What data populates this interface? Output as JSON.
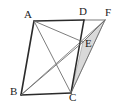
{
  "figure": {
    "kind": "geometry-diagram",
    "width": 122,
    "height": 109,
    "background_color": "#ffffff",
    "stroke_color_main": "#2b2b2b",
    "stroke_color_thin": "#6e6e6e",
    "shade_fill_color": "#d9d9d9",
    "shade_stroke_color": "#8a8a8a"
  },
  "labels": {
    "a": "A",
    "b": "B",
    "c": "C",
    "d": "D",
    "e": "E",
    "f": "F"
  },
  "points": {
    "A": {
      "x": 34,
      "y": 21
    },
    "B": {
      "x": 21,
      "y": 95
    },
    "C": {
      "x": 71,
      "y": 93
    },
    "D": {
      "x": 84,
      "y": 20
    },
    "E": {
      "x": 83,
      "y": 42
    },
    "F": {
      "x": 105,
      "y": 20
    }
  },
  "label_positions": {
    "A": {
      "x": 24,
      "y": 9
    },
    "B": {
      "x": 10,
      "y": 87
    },
    "C": {
      "x": 69,
      "y": 92
    },
    "D": {
      "x": 80,
      "y": 6
    },
    "E": {
      "x": 85,
      "y": 39
    },
    "F": {
      "x": 106,
      "y": 7
    }
  },
  "segments": [
    {
      "name": "segment-AD",
      "from": "A",
      "to": "D",
      "weight": "main"
    },
    {
      "name": "segment-DF",
      "from": "D",
      "to": "F",
      "weight": "thin"
    },
    {
      "name": "segment-AB",
      "from": "A",
      "to": "B",
      "weight": "main"
    },
    {
      "name": "segment-BC",
      "from": "B",
      "to": "C",
      "weight": "main"
    },
    {
      "name": "segment-DC",
      "from": "D",
      "to": "C",
      "weight": "main"
    },
    {
      "name": "segment-AC",
      "from": "A",
      "to": "C",
      "weight": "thin"
    },
    {
      "name": "segment-AF",
      "from": "A",
      "to": "F",
      "weight": "thin"
    },
    {
      "name": "segment-BE",
      "from": "B",
      "to": "E",
      "weight": "thin"
    },
    {
      "name": "segment-BF",
      "from": "B",
      "to": "F",
      "weight": "thin"
    },
    {
      "name": "segment-CF",
      "from": "C",
      "to": "F",
      "weight": "thin"
    }
  ],
  "shaded_region": {
    "name": "triangle-CEF",
    "vertices": [
      "C",
      "E",
      "F"
    ],
    "fill": "#d9d9d9"
  }
}
